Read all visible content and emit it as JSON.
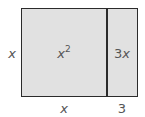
{
  "diagram": {
    "type": "area-model",
    "side_label": "x",
    "regions": [
      {
        "label_base": "x",
        "label_exp": "2",
        "width_label": "x"
      },
      {
        "label_coef": "3",
        "label_var": "x",
        "width_label": "3"
      }
    ],
    "colors": {
      "fill": "#e1e1e1",
      "stroke": "#2b2b2b",
      "text": "#555555"
    }
  }
}
